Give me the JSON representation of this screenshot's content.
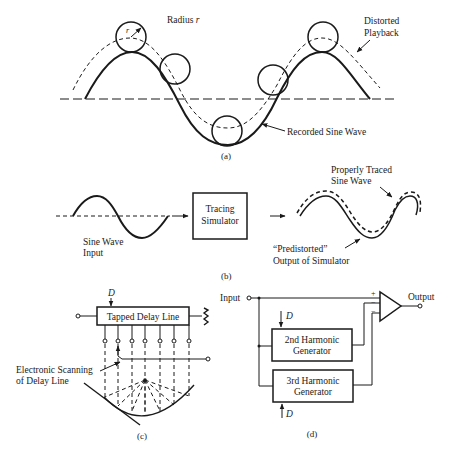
{
  "figure_a": {
    "radius_label": "Radius",
    "radius_symbol": "r",
    "r_marker": "r",
    "distorted_label_1": "Distorted",
    "distorted_label_2": "Playback",
    "recorded_label": "Recorded Sine Wave",
    "caption": "(a)"
  },
  "figure_b": {
    "input_label_1": "Sine Wave",
    "input_label_2": "Input",
    "simulator_label_1": "Tracing",
    "simulator_label_2": "Simulator",
    "traced_label_1": "Properly Traced",
    "traced_label_2": "Sine Wave",
    "predistorted_label_1": "“Predistorted”",
    "predistorted_label_2": "Output of Simulator",
    "caption": "(b)"
  },
  "figure_c": {
    "d_label": "D",
    "delay_line_label": "Tapped Delay Line",
    "scanning_label_1": "Electronic Scanning",
    "scanning_label_2": "of Delay Line",
    "caption": "(c)"
  },
  "figure_d": {
    "input_label": "Input",
    "output_label": "Output",
    "plus_sign": "+",
    "minus_sign": "−",
    "gen2_label_1": "2nd Harmonic",
    "gen2_label_2": "Generator",
    "gen3_label_1": "3rd Harmonic",
    "gen3_label_2": "Generator",
    "d_top": "D",
    "d_bottom": "D",
    "caption": "(d)"
  }
}
